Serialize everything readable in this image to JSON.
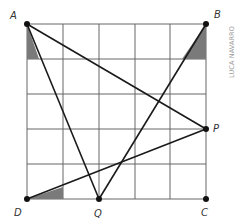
{
  "figure": {
    "type": "grid-geometry",
    "grid": {
      "rows": 5,
      "cols": 5,
      "origin": [
        27,
        24
      ],
      "cell_w": 35.8,
      "cell_h": 35,
      "line_color": "#555555"
    },
    "points": [
      {
        "label": "A",
        "x": 27,
        "y": 24,
        "grid": [
          0,
          5
        ]
      },
      {
        "label": "B",
        "x": 206,
        "y": 24,
        "grid": [
          5,
          5
        ]
      },
      {
        "label": "C",
        "x": 206,
        "y": 199,
        "grid": [
          5,
          0
        ]
      },
      {
        "label": "D",
        "x": 27,
        "y": 199,
        "grid": [
          0,
          0
        ]
      },
      {
        "label": "P",
        "x": 206,
        "y": 129,
        "grid": [
          5,
          2
        ]
      },
      {
        "label": "Q",
        "x": 99,
        "y": 199,
        "grid": [
          2,
          0
        ]
      }
    ],
    "segments": [
      [
        "A",
        "Q"
      ],
      [
        "A",
        "P"
      ],
      [
        "B",
        "Q"
      ],
      [
        "D",
        "P"
      ]
    ],
    "shaded_angles": [
      "A",
      "B",
      "D"
    ],
    "shade_color": "#777777",
    "credit": "LUCA NAVARRO"
  }
}
